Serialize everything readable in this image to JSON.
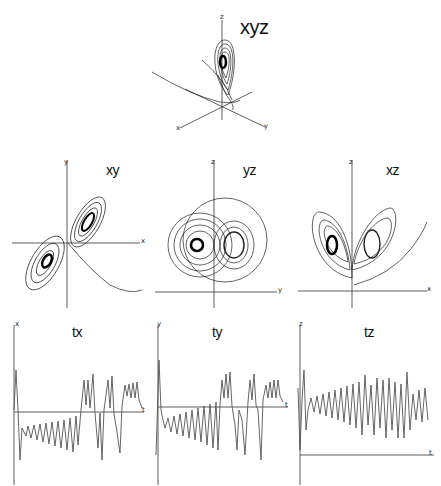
{
  "figure": {
    "panels": {
      "xyz": {
        "title": "xyz",
        "axes": {
          "x": "x",
          "y": "y",
          "z": "z"
        }
      },
      "xy": {
        "title": "xy",
        "axes": {
          "h": "x",
          "v": "y"
        }
      },
      "yz": {
        "title": "yz",
        "axes": {
          "h": "y",
          "v": "z"
        }
      },
      "xz": {
        "title": "xz",
        "axes": {
          "h": "x",
          "v": "z"
        }
      },
      "tx": {
        "title": "tx",
        "axes": {
          "h": "t",
          "v": "x"
        }
      },
      "ty": {
        "title": "ty",
        "axes": {
          "h": "t",
          "v": "y"
        }
      },
      "tz": {
        "title": "tz",
        "axes": {
          "h": "t",
          "v": "z"
        }
      }
    }
  },
  "colors": {
    "trace": "#222222",
    "axis": "#333333",
    "background": "#ffffff"
  }
}
